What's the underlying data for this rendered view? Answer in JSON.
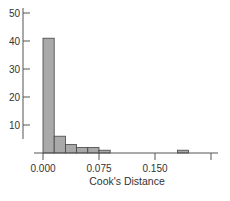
{
  "chart_data": {
    "type": "bar",
    "title": "",
    "xlabel": "Cook's Distance",
    "ylabel": "",
    "bin_width": 0.015,
    "bins": [
      {
        "start": 0.0,
        "end": 0.015,
        "count": 41
      },
      {
        "start": 0.015,
        "end": 0.03,
        "count": 6
      },
      {
        "start": 0.03,
        "end": 0.045,
        "count": 3
      },
      {
        "start": 0.045,
        "end": 0.06,
        "count": 2
      },
      {
        "start": 0.06,
        "end": 0.075,
        "count": 2
      },
      {
        "start": 0.075,
        "end": 0.09,
        "count": 1
      },
      {
        "start": 0.18,
        "end": 0.195,
        "count": 1
      }
    ],
    "categories": [
      "0.000-0.015",
      "0.015-0.030",
      "0.030-0.045",
      "0.045-0.060",
      "0.060-0.075",
      "0.075-0.090",
      "0.180-0.195"
    ],
    "values": [
      41,
      6,
      3,
      2,
      2,
      1,
      1
    ],
    "x_ticks": [
      "0.000",
      "0.075",
      "0.150"
    ],
    "x_tick_values": [
      0.0,
      0.075,
      0.15,
      0.225
    ],
    "y_ticks": [
      "10",
      "20",
      "30",
      "40",
      "50"
    ],
    "xlim": [
      -0.012,
      0.225
    ],
    "ylim": [
      0,
      50
    ],
    "grid": false,
    "legend": null,
    "colors": {
      "bar_fill": "#a9a9a9",
      "bar_stroke": "#444444",
      "axis": "#555555"
    }
  }
}
